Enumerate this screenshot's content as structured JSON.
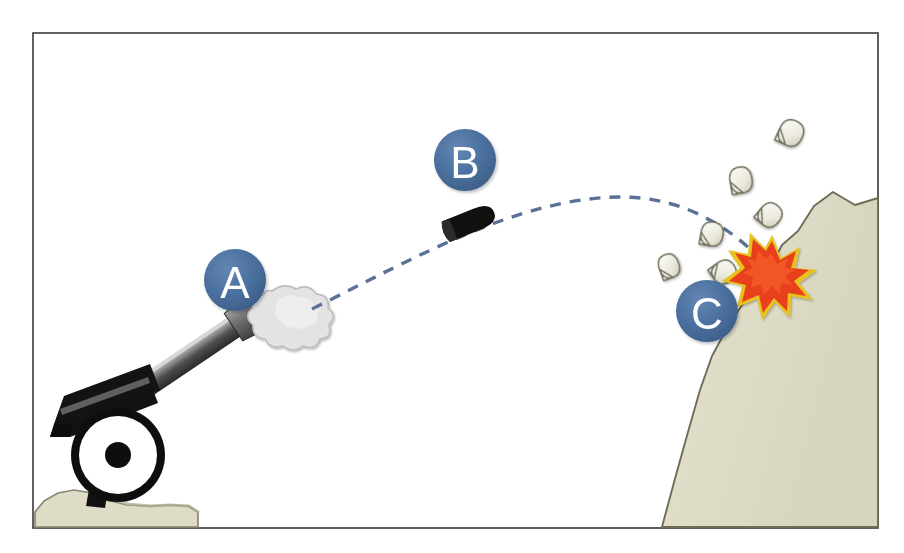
{
  "figure": {
    "frame": {
      "x": 33,
      "y": 33,
      "width": 845,
      "height": 495,
      "border_color": "#3b3b3b",
      "background_color": "#ffffff"
    }
  },
  "markers": [
    {
      "id": "marker-a",
      "label": "A",
      "meaning": "muzzle-blast",
      "cx": 235,
      "cy": 280,
      "r": 31,
      "fill": "#4a6f9e",
      "label_color": "#ffffff"
    },
    {
      "id": "marker-b",
      "label": "B",
      "meaning": "projectile-in-flight",
      "cx": 465,
      "cy": 160,
      "r": 31,
      "fill": "#4a6f9e",
      "label_color": "#ffffff"
    },
    {
      "id": "marker-c",
      "label": "C",
      "meaning": "impact-point",
      "cx": 707,
      "cy": 311,
      "r": 31,
      "fill": "#4a6f9e",
      "label_color": "#ffffff"
    }
  ],
  "trajectory": {
    "name": "projectile-path",
    "style": "dashed",
    "color": "#5b7296",
    "stroke_width": 3.4,
    "dash_pattern": "11 9",
    "path": "M 312 309 C 420 255 520 198 620 197 C 690 197 735 232 770 268"
  },
  "cannon": {
    "name": "field-cannon",
    "barrel": {
      "color_dark": "#3a3a3a",
      "color_light": "#c9c9c9",
      "muzzle_color": "#545454",
      "angle_deg": -34
    },
    "carriage": {
      "color": "#121212"
    },
    "wheel": {
      "cx": 118,
      "cy": 455,
      "outer_r": 47,
      "rim_color": "#101010",
      "face_color": "#ffffff",
      "hub_r": 13,
      "hub_color": "#101010"
    }
  },
  "smoke": {
    "name": "muzzle-smoke-cloud",
    "cx": 288,
    "cy": 317,
    "fill": "#e3e3e3",
    "stroke": "#b8b8b8"
  },
  "projectile": {
    "name": "cannon-shell",
    "cx": 470,
    "cy": 222,
    "length": 52,
    "height": 23,
    "angle_deg": -22,
    "fill": "#101010"
  },
  "explosion": {
    "name": "impact-burst",
    "cx": 772,
    "cy": 273,
    "outer_r": 34,
    "inner_r": 16,
    "points": 12,
    "fill": "#e8401a",
    "edge_color": "#e8c21c"
  },
  "terrain": {
    "cliff": {
      "name": "rock-cliff",
      "fill": "#dedbc6",
      "stroke": "#6e6c56",
      "path": "M 878 198 L 855 205 L 833 192 L 814 206 L 798 231 L 782 245 L 770 268 L 758 287 L 742 305 L 726 330 L 712 356 L 700 390 L 688 432 L 676 475 L 666 512 L 662 527 L 878 527 Z"
    },
    "mound": {
      "name": "ground-mound",
      "fill": "#dedbc6",
      "stroke": "#8a8872",
      "path": "M 35 510 L 44 500 L 58 492 L 74 489 L 92 492 L 106 499 L 126 504 L 148 505 L 168 504 L 186 505 L 197 510 L 198 527 L 35 527 Z"
    }
  },
  "debris": [
    {
      "name": "rock-fragment",
      "cx": 791,
      "cy": 133,
      "rx": 12,
      "ry": 13,
      "rot": 25
    },
    {
      "name": "rock-fragment",
      "cx": 741,
      "cy": 180,
      "rx": 11,
      "ry": 13,
      "rot": -10
    },
    {
      "name": "rock-fragment",
      "cx": 770,
      "cy": 215,
      "rx": 11,
      "ry": 12,
      "rot": 40
    },
    {
      "name": "rock-fragment",
      "cx": 712,
      "cy": 234,
      "rx": 11,
      "ry": 12,
      "rot": 10
    },
    {
      "name": "rock-fragment",
      "cx": 669,
      "cy": 266,
      "rx": 10,
      "ry": 12,
      "rot": -20
    },
    {
      "name": "rock-fragment",
      "cx": 724,
      "cy": 272,
      "rx": 11,
      "ry": 12,
      "rot": 55
    }
  ],
  "palette": {
    "marker_blue": "#4a6f9e",
    "trajectory_blue": "#5b7296",
    "explosion_red": "#e8401a",
    "explosion_yellow": "#e8c21c",
    "terrain_beige": "#dedbc6",
    "cannon_black": "#121212",
    "smoke_gray": "#e3e3e3",
    "frame_line": "#3b3b3b"
  }
}
